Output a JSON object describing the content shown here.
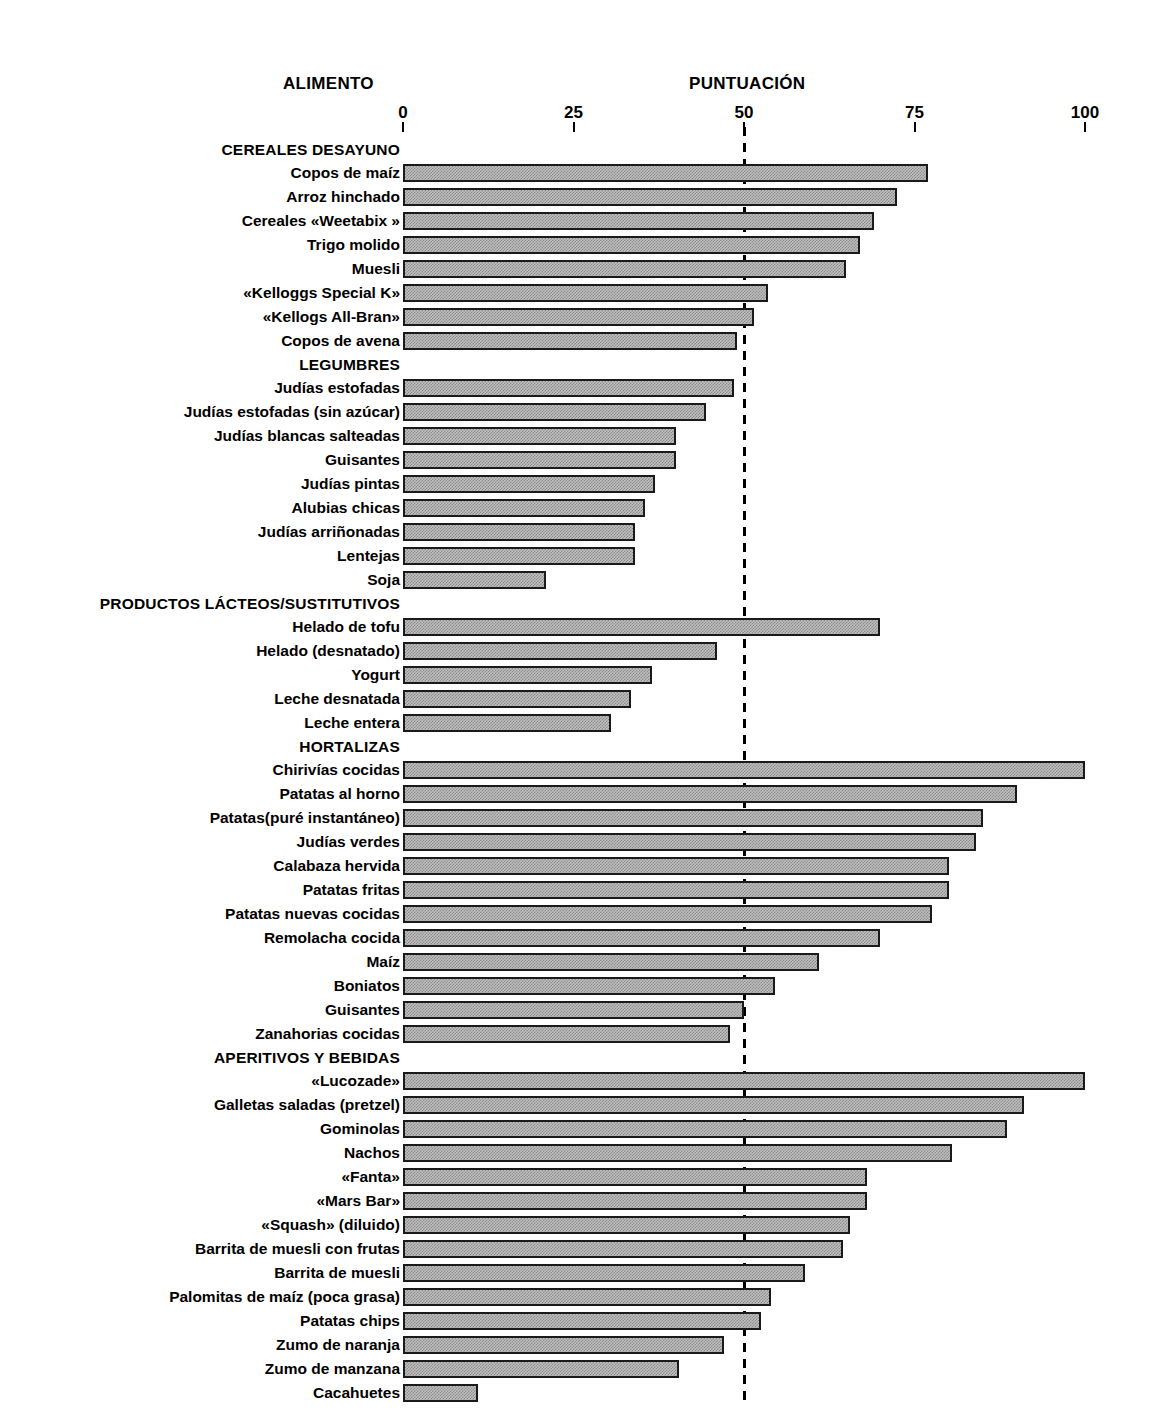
{
  "header": {
    "food_column_title": "ALIMENTO",
    "score_column_title": "PUNTUACIÓN"
  },
  "axis": {
    "ticks": [
      "0",
      "25",
      "50",
      "75",
      "100"
    ],
    "reference_line_value": 50
  },
  "chart_data": {
    "type": "bar",
    "orientation": "horizontal",
    "title": "PUNTUACIÓN",
    "xlabel": "PUNTUACIÓN",
    "ylabel": "ALIMENTO",
    "xlim": [
      0,
      100
    ],
    "xticks": [
      0,
      25,
      50,
      75,
      100
    ],
    "grid": false,
    "legend": "none",
    "reference_line": 50,
    "groups": [
      {
        "name": "CEREALES DESAYUNO",
        "categories": [
          "Copos de maíz",
          "Arroz hinchado",
          "Cereales «Weetabix »",
          "Trigo molido",
          "Muesli",
          "«Kelloggs Special K»",
          "«Kellogs All-Bran»",
          "Copos de avena"
        ],
        "values": [
          77,
          72.5,
          69,
          67,
          65,
          53.5,
          51.5,
          49
        ]
      },
      {
        "name": "LEGUMBRES",
        "categories": [
          "Judías estofadas",
          "Judías estofadas (sin azúcar)",
          "Judías blancas salteadas",
          "Guisantes",
          "Judías pintas",
          "Alubias chicas",
          "Judías arriñonadas",
          "Lentejas",
          "Soja"
        ],
        "values": [
          48.5,
          44.5,
          40,
          40,
          37,
          35.5,
          34,
          34,
          21
        ]
      },
      {
        "name": "PRODUCTOS LÁCTEOS/SUSTITUTIVOS",
        "categories": [
          "Helado de tofu",
          "Helado (desnatado)",
          "Yogurt",
          "Leche desnatada",
          "Leche entera"
        ],
        "values": [
          70,
          46,
          36.5,
          33.5,
          30.5
        ]
      },
      {
        "name": "HORTALIZAS",
        "categories": [
          "Chirivías cocidas",
          "Patatas al horno",
          "Patatas(puré instantáneo)",
          "Judías verdes",
          "Calabaza hervida",
          "Patatas fritas",
          "Patatas nuevas cocidas",
          "Remolacha cocida",
          "Maíz",
          "Boniatos",
          "Guisantes",
          "Zanahorias cocidas"
        ],
        "values": [
          100,
          90,
          85,
          84,
          80,
          80,
          77.5,
          70,
          61,
          54.5,
          50,
          48
        ]
      },
      {
        "name": "APERITIVOS Y BEBIDAS",
        "categories": [
          "«Lucozade»",
          "Galletas saladas (pretzel)",
          "Gominolas",
          "Nachos",
          "«Fanta»",
          "«Mars Bar»",
          "«Squash» (diluido)",
          "Barrita de muesli con frutas",
          "Barrita de muesli",
          "Palomitas de maíz (poca grasa)",
          "Patatas chips",
          "Zumo de naranja",
          "Zumo de manzana",
          "Cacahuetes"
        ],
        "values": [
          100,
          91,
          88.5,
          80.5,
          68,
          68,
          65.5,
          64.5,
          59,
          54,
          52.5,
          47,
          40.5,
          11
        ]
      }
    ]
  },
  "colors": {
    "bar_fill": "#c0c0c0",
    "bar_border": "#1a1a1a",
    "text": "#000000",
    "background": "#ffffff"
  }
}
